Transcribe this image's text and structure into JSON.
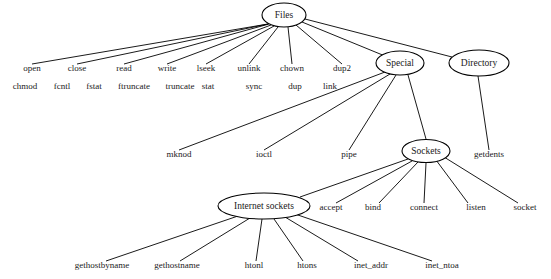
{
  "diagram": {
    "type": "tree",
    "width": 551,
    "height": 279,
    "background": "#ffffff",
    "line_color": "#000000",
    "text_color": "#1a1a1a",
    "nodes": [
      {
        "id": "files",
        "label": "Files",
        "shape": "ellipse",
        "cx": 284,
        "cy": 15,
        "rx": 22,
        "ry": 12
      },
      {
        "id": "special",
        "label": "Special",
        "shape": "ellipse",
        "cx": 400,
        "cy": 63,
        "rx": 24,
        "ry": 12
      },
      {
        "id": "directory",
        "label": "Directory",
        "shape": "ellipse",
        "cx": 479,
        "cy": 63,
        "rx": 30,
        "ry": 13
      },
      {
        "id": "sockets",
        "label": "Sockets",
        "shape": "ellipse",
        "cx": 426,
        "cy": 151,
        "rx": 24,
        "ry": 11.5
      },
      {
        "id": "internet_sockets",
        "label": "Internet sockets",
        "shape": "ellipse",
        "cx": 264,
        "cy": 206,
        "rx": 46,
        "ry": 13
      }
    ],
    "leaves": [
      {
        "id": "open",
        "label": "open",
        "x": 32,
        "y": 71
      },
      {
        "id": "close",
        "label": "close",
        "x": 77,
        "y": 71
      },
      {
        "id": "read",
        "label": "read",
        "x": 124,
        "y": 71
      },
      {
        "id": "write",
        "label": "write",
        "x": 167,
        "y": 71
      },
      {
        "id": "lseek",
        "label": "lseek",
        "x": 206,
        "y": 71
      },
      {
        "id": "unlink",
        "label": "unlink",
        "x": 249,
        "y": 71
      },
      {
        "id": "chown",
        "label": "chown",
        "x": 292,
        "y": 71
      },
      {
        "id": "dup2",
        "label": "dup2",
        "x": 342,
        "y": 71
      },
      {
        "id": "chmod",
        "label": "chmod",
        "x": 25,
        "y": 89
      },
      {
        "id": "fcntl",
        "label": "fcntl",
        "x": 62,
        "y": 89
      },
      {
        "id": "fstat",
        "label": "fstat",
        "x": 94,
        "y": 89
      },
      {
        "id": "ftruncate",
        "label": "ftruncate",
        "x": 134,
        "y": 89
      },
      {
        "id": "truncate",
        "label": "truncate",
        "x": 180,
        "y": 89
      },
      {
        "id": "stat",
        "label": "stat",
        "x": 208,
        "y": 89
      },
      {
        "id": "sync",
        "label": "sync",
        "x": 254,
        "y": 89
      },
      {
        "id": "dup",
        "label": "dup",
        "x": 295,
        "y": 89
      },
      {
        "id": "link",
        "label": "link",
        "x": 330,
        "y": 89
      },
      {
        "id": "mknod",
        "label": "mknod",
        "x": 179,
        "y": 157
      },
      {
        "id": "ioctl",
        "label": "ioctl",
        "x": 264,
        "y": 157
      },
      {
        "id": "pipe",
        "label": "pipe",
        "x": 349,
        "y": 157
      },
      {
        "id": "getdents",
        "label": "getdents",
        "x": 489,
        "y": 157
      },
      {
        "id": "accept",
        "label": "accept",
        "x": 331,
        "y": 210
      },
      {
        "id": "bind",
        "label": "bind",
        "x": 373,
        "y": 210
      },
      {
        "id": "connect",
        "label": "connect",
        "x": 424,
        "y": 210
      },
      {
        "id": "listen",
        "label": "listen",
        "x": 476,
        "y": 210
      },
      {
        "id": "socket",
        "label": "socket",
        "x": 525,
        "y": 210
      },
      {
        "id": "gethostbyname",
        "label": "gethostbyname",
        "x": 102,
        "y": 268
      },
      {
        "id": "gethostname",
        "label": "gethostname",
        "x": 177,
        "y": 268
      },
      {
        "id": "htonl",
        "label": "htonl",
        "x": 254,
        "y": 268
      },
      {
        "id": "htons",
        "label": "htons",
        "x": 307,
        "y": 268
      },
      {
        "id": "inet_addr",
        "label": "inet_addr",
        "x": 371,
        "y": 268
      },
      {
        "id": "inet_ntoa",
        "label": "inet_ntoa",
        "x": 442,
        "y": 268
      }
    ],
    "edges": [
      {
        "from": "files",
        "to": "open",
        "x1": 268,
        "y1": 24,
        "x2": 32,
        "y2": 64
      },
      {
        "from": "files",
        "to": "close",
        "x1": 268,
        "y1": 24,
        "x2": 77,
        "y2": 64
      },
      {
        "from": "files",
        "to": "read",
        "x1": 269,
        "y1": 24,
        "x2": 124,
        "y2": 64
      },
      {
        "from": "files",
        "to": "write",
        "x1": 271,
        "y1": 25,
        "x2": 167,
        "y2": 64
      },
      {
        "from": "files",
        "to": "lseek",
        "x1": 274,
        "y1": 26,
        "x2": 206,
        "y2": 64
      },
      {
        "from": "files",
        "to": "unlink",
        "x1": 278,
        "y1": 27,
        "x2": 249,
        "y2": 64
      },
      {
        "from": "files",
        "to": "chown",
        "x1": 288,
        "y1": 27,
        "x2": 292,
        "y2": 64
      },
      {
        "from": "files",
        "to": "dup2",
        "x1": 296,
        "y1": 25,
        "x2": 342,
        "y2": 64
      },
      {
        "from": "files",
        "to": "special",
        "x1": 302,
        "y1": 22,
        "x2": 385,
        "y2": 56
      },
      {
        "from": "files",
        "to": "directory",
        "x1": 305,
        "y1": 19,
        "x2": 452,
        "y2": 57
      },
      {
        "from": "special",
        "to": "mknod",
        "x1": 385,
        "y1": 72,
        "x2": 179,
        "y2": 150
      },
      {
        "from": "special",
        "to": "ioctl",
        "x1": 390,
        "y1": 74,
        "x2": 264,
        "y2": 150
      },
      {
        "from": "special",
        "to": "pipe",
        "x1": 396,
        "y1": 75,
        "x2": 349,
        "y2": 150
      },
      {
        "from": "special",
        "to": "sockets",
        "x1": 408,
        "y1": 75,
        "x2": 426,
        "y2": 139
      },
      {
        "from": "directory",
        "to": "getdents",
        "x1": 478,
        "y1": 76,
        "x2": 489,
        "y2": 150
      },
      {
        "from": "sockets",
        "to": "internet_sockets",
        "x1": 408,
        "y1": 159,
        "x2": 300,
        "y2": 197
      },
      {
        "from": "sockets",
        "to": "accept",
        "x1": 412,
        "y1": 161,
        "x2": 336,
        "y2": 203
      },
      {
        "from": "sockets",
        "to": "bind",
        "x1": 418,
        "y1": 162,
        "x2": 379,
        "y2": 203
      },
      {
        "from": "sockets",
        "to": "connect",
        "x1": 426,
        "y1": 163,
        "x2": 424,
        "y2": 203
      },
      {
        "from": "sockets",
        "to": "listen",
        "x1": 436,
        "y1": 160,
        "x2": 468,
        "y2": 203
      },
      {
        "from": "sockets",
        "to": "socket",
        "x1": 444,
        "y1": 157,
        "x2": 518,
        "y2": 203
      },
      {
        "from": "internet_sockets",
        "to": "gethostbyname",
        "x1": 238,
        "y1": 216,
        "x2": 106,
        "y2": 261
      },
      {
        "from": "internet_sockets",
        "to": "gethostname",
        "x1": 250,
        "y1": 218,
        "x2": 180,
        "y2": 261
      },
      {
        "from": "internet_sockets",
        "to": "htonl",
        "x1": 262,
        "y1": 219,
        "x2": 256,
        "y2": 261
      },
      {
        "from": "internet_sockets",
        "to": "htons",
        "x1": 274,
        "y1": 219,
        "x2": 303,
        "y2": 261
      },
      {
        "from": "internet_sockets",
        "to": "inet_addr",
        "x1": 285,
        "y1": 217,
        "x2": 358,
        "y2": 261
      },
      {
        "from": "internet_sockets",
        "to": "inet_ntoa",
        "x1": 295,
        "y1": 214,
        "x2": 432,
        "y2": 261
      }
    ]
  }
}
